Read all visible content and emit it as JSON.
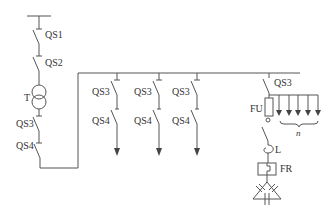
{
  "diagram": {
    "type": "single-line electrical distribution schematic",
    "incoming": {
      "switches": [
        "QS1",
        "QS2"
      ],
      "transformer": "T",
      "secondary_switches": [
        "QS3",
        "QS4"
      ]
    },
    "feeders": [
      {
        "switch_top": "QS3",
        "switch_bottom": "QS4"
      },
      {
        "switch_top": "QS3",
        "switch_bottom": "QS4"
      },
      {
        "switch_top": "QS3",
        "switch_bottom": "QS4"
      }
    ],
    "capacitor_branch": {
      "switch": "QS3",
      "fuse": "FU",
      "reactor": "L",
      "relay": "FR",
      "outputs_label": "n",
      "outputs_count": 5
    }
  },
  "labels": {
    "qs1": "QS1",
    "qs2": "QS2",
    "t": "T",
    "qs3_main": "QS3",
    "qs4_main": "QS4",
    "f1_qs3": "QS3",
    "f1_qs4": "QS4",
    "f2_qs3": "QS3",
    "f2_qs4": "QS4",
    "f3_qs3": "QS3",
    "f3_qs4": "QS4",
    "cap_qs3": "QS3",
    "fu": "FU",
    "l": "L",
    "fr": "FR",
    "n": "n"
  }
}
